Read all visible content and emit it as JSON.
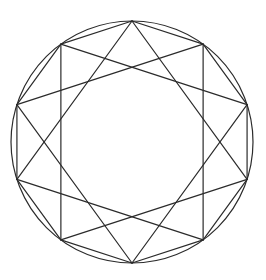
{
  "figure": {
    "width": 266,
    "height": 280,
    "background": "#ffffff",
    "stroke_color": "#2b2b2b",
    "stroke_width": 1.2,
    "circle": {
      "cx": 132,
      "cy": 142,
      "r": 121
    },
    "polygon": {
      "sides": 10,
      "start_angle_deg": -90,
      "radius": 121
    },
    "star": {
      "n": 10,
      "step": 3
    }
  }
}
